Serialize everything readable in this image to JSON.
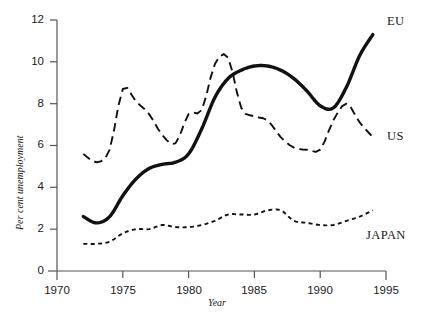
{
  "chart_data": {
    "type": "line",
    "title": "",
    "xlabel": "Year",
    "ylabel": "Per cent unemployment",
    "xlim": [
      1970,
      1995
    ],
    "ylim": [
      0,
      12
    ],
    "xticks": [
      1970,
      1975,
      1980,
      1985,
      1990,
      1995
    ],
    "xtick_labels": [
      "1970",
      "1975",
      "1980",
      "1985",
      "1990",
      "1995"
    ],
    "yticks": [
      0,
      2,
      4,
      6,
      8,
      10,
      12
    ],
    "ytick_labels": [
      "0",
      "2",
      "4",
      "6",
      "8",
      "10",
      "12"
    ],
    "grid": false,
    "legend_position": "right-inline-labels",
    "x": [
      1972,
      1973,
      1974,
      1975,
      1976,
      1977,
      1978,
      1979,
      1980,
      1981,
      1982,
      1983,
      1984,
      1985,
      1986,
      1987,
      1988,
      1989,
      1990,
      1991,
      1992,
      1993,
      1994
    ],
    "series": [
      {
        "name": "EU",
        "label": "EU",
        "style": "solid-thick",
        "color": "#111111",
        "values": [
          2.6,
          2.3,
          2.6,
          3.6,
          4.4,
          4.9,
          5.1,
          5.2,
          5.6,
          6.8,
          8.3,
          9.2,
          9.6,
          9.8,
          9.8,
          9.6,
          9.2,
          8.6,
          7.9,
          7.8,
          8.8,
          10.3,
          11.3
        ]
      },
      {
        "name": "US",
        "label": "US",
        "style": "dashed",
        "color": "#111111",
        "values": [
          5.6,
          5.2,
          5.8,
          8.7,
          8.1,
          7.5,
          6.5,
          6.1,
          7.5,
          7.7,
          9.9,
          10.2,
          7.8,
          7.4,
          7.2,
          6.4,
          5.9,
          5.8,
          5.8,
          7.2,
          8.0,
          7.1,
          6.4
        ]
      },
      {
        "name": "JAPAN",
        "label": "JAPAN",
        "style": "dotted",
        "color": "#111111",
        "values": [
          1.3,
          1.3,
          1.4,
          1.8,
          2.0,
          2.0,
          2.2,
          2.1,
          2.1,
          2.2,
          2.4,
          2.7,
          2.7,
          2.7,
          2.9,
          2.9,
          2.4,
          2.3,
          2.2,
          2.2,
          2.4,
          2.6,
          2.9
        ]
      }
    ]
  },
  "axes": {
    "ylabel": "Per cent unemployment",
    "xlabel": "Year",
    "ytick_labels": [
      "12",
      "10",
      "8",
      "6",
      "4",
      "2",
      "0"
    ],
    "xtick_labels": [
      "1970",
      "1975",
      "1980",
      "1985",
      "1990",
      "1995"
    ]
  },
  "series_labels": {
    "eu": "EU",
    "us": "US",
    "japan": "JAPAN"
  },
  "colors": {
    "ink": "#111111",
    "axis": "#555555",
    "background": "#ffffff"
  }
}
